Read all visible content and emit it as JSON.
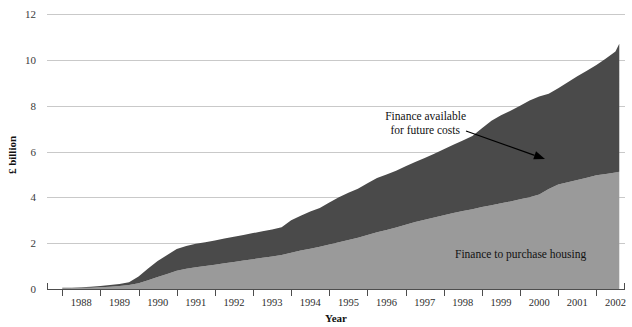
{
  "chart_data": {
    "type": "area",
    "title": "",
    "xlabel": "Year",
    "ylabel": "£ billion",
    "ylim": [
      0,
      12
    ],
    "xlim": [
      1987.6,
      2002.75
    ],
    "yticks": [
      "0",
      "2",
      "4",
      "6",
      "8",
      "10",
      "12"
    ],
    "ytick_values": [
      0,
      2,
      4,
      6,
      8,
      10,
      12
    ],
    "grid": true,
    "legend_position": "inline-annotations",
    "stacked": true,
    "categories": [
      "1988.0",
      "1988.25",
      "1988.5",
      "1988.75",
      "1989.0",
      "1989.25",
      "1989.5",
      "1989.75",
      "1990.0",
      "1990.25",
      "1990.5",
      "1990.75",
      "1991.0",
      "1991.25",
      "1991.5",
      "1991.75",
      "1992.0",
      "1992.25",
      "1992.5",
      "1992.75",
      "1993.0",
      "1993.25",
      "1993.5",
      "1993.75",
      "1994.0",
      "1994.25",
      "1994.5",
      "1994.75",
      "1995.0",
      "1995.25",
      "1995.5",
      "1995.75",
      "1996.0",
      "1996.25",
      "1996.5",
      "1996.75",
      "1997.0",
      "1997.25",
      "1997.5",
      "1997.75",
      "1998.0",
      "1998.25",
      "1998.5",
      "1998.75",
      "1999.0",
      "1999.25",
      "1999.5",
      "1999.75",
      "2000.0",
      "2000.25",
      "2000.5",
      "2000.75",
      "2001.0",
      "2001.25",
      "2001.5",
      "2001.75",
      "2002.0",
      "2002.25",
      "2002.5",
      "2002.6"
    ],
    "series": [
      {
        "name": "Finance to purchase housing",
        "color": "#9a9a9a",
        "values": [
          0.03,
          0.04,
          0.05,
          0.06,
          0.08,
          0.1,
          0.13,
          0.17,
          0.25,
          0.38,
          0.52,
          0.66,
          0.8,
          0.88,
          0.95,
          1.0,
          1.06,
          1.12,
          1.18,
          1.24,
          1.3,
          1.36,
          1.42,
          1.48,
          1.58,
          1.68,
          1.76,
          1.84,
          1.94,
          2.04,
          2.14,
          2.24,
          2.36,
          2.48,
          2.58,
          2.68,
          2.8,
          2.92,
          3.02,
          3.12,
          3.22,
          3.32,
          3.4,
          3.48,
          3.58,
          3.66,
          3.74,
          3.82,
          3.92,
          4.0,
          4.12,
          4.36,
          4.56,
          4.66,
          4.76,
          4.86,
          4.96,
          5.02,
          5.08,
          5.12
        ]
      },
      {
        "name": "Finance available for future costs",
        "color": "#4a4a4a",
        "values": [
          0.02,
          0.02,
          0.03,
          0.04,
          0.05,
          0.07,
          0.09,
          0.13,
          0.3,
          0.52,
          0.7,
          0.82,
          0.95,
          1.0,
          1.02,
          1.04,
          1.06,
          1.08,
          1.1,
          1.12,
          1.14,
          1.16,
          1.18,
          1.22,
          1.42,
          1.52,
          1.62,
          1.7,
          1.84,
          1.96,
          2.06,
          2.14,
          2.26,
          2.36,
          2.42,
          2.48,
          2.56,
          2.62,
          2.7,
          2.78,
          2.88,
          2.98,
          3.08,
          3.2,
          3.44,
          3.68,
          3.84,
          3.96,
          4.08,
          4.22,
          4.28,
          4.16,
          4.2,
          4.36,
          4.52,
          4.66,
          4.82,
          5.04,
          5.28,
          5.58
        ]
      }
    ],
    "totals": [
      0.05,
      0.06,
      0.08,
      0.1,
      0.13,
      0.17,
      0.22,
      0.3,
      0.55,
      0.9,
      1.22,
      1.48,
      1.75,
      1.88,
      1.97,
      2.04,
      2.12,
      2.2,
      2.28,
      2.36,
      2.44,
      2.52,
      2.6,
      2.7,
      3.0,
      3.2,
      3.38,
      3.54,
      3.78,
      4.0,
      4.2,
      4.38,
      4.62,
      4.84,
      5.0,
      5.16,
      5.36,
      5.54,
      5.72,
      5.9,
      6.1,
      6.3,
      6.48,
      6.68,
      7.02,
      7.34,
      7.58,
      7.78,
      8.0,
      8.22,
      8.4,
      8.52,
      8.76,
      9.02,
      9.28,
      9.52,
      9.78,
      10.06,
      10.36,
      10.7
    ],
    "annotations": [
      {
        "name": "future-costs-annotation",
        "line1": "Finance available",
        "line2": "for future costs",
        "arrow_from": [
          466,
          131
        ],
        "arrow_to": [
          545,
          159
        ]
      },
      {
        "name": "purchase-housing-label",
        "text": "Finance to purchase housing",
        "position": [
          455,
          258
        ]
      }
    ]
  },
  "axes": {
    "y_title": "£ billion",
    "x_title": "Year",
    "y_labels": [
      "12",
      "10",
      "8",
      "6",
      "4",
      "2",
      "0"
    ],
    "x_labels": [
      "1988",
      "1989",
      "1990",
      "1991",
      "1992",
      "1993",
      "1994",
      "1995",
      "1996",
      "1997",
      "1998",
      "1999",
      "2000",
      "2001",
      "2002"
    ]
  },
  "colors": {
    "upper_band": "#4a4a4a",
    "lower_band": "#9a9a9a",
    "gridline": "#bcbcbc",
    "axis": "#4d4d4d",
    "text": "#111111",
    "background": "#ffffff"
  }
}
